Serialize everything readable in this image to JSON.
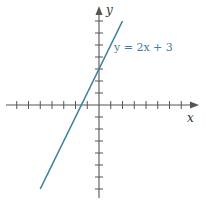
{
  "chart_data": {
    "type": "line",
    "title": "",
    "xlabel": "x",
    "ylabel": "y",
    "xlim": [
      -7,
      8
    ],
    "ylim": [
      -8,
      8
    ],
    "grid": false,
    "series": [
      {
        "name": "y = 2x + 3",
        "equation": "y = 2x + 3",
        "slope": 2,
        "intercept": 3,
        "x": [
          -5,
          2
        ],
        "values": [
          -7,
          7
        ],
        "color": "#3e7ea0"
      }
    ],
    "annotations": [
      {
        "text": "y = 2x + 3",
        "position": "right of line near top"
      }
    ],
    "x_ticks": [
      -7,
      -6,
      -5,
      -4,
      -3,
      -2,
      -1,
      1,
      2,
      3,
      4,
      5,
      6,
      7
    ],
    "y_ticks": [
      -7,
      -6,
      -5,
      -4,
      -3,
      -2,
      -1,
      1,
      2,
      3,
      4,
      5,
      6,
      7
    ]
  },
  "labels": {
    "x_axis": "x",
    "y_axis": "y",
    "equation": "y = 2x + 3"
  },
  "colors": {
    "line": "#3e7ea0",
    "axis": "#555555"
  }
}
